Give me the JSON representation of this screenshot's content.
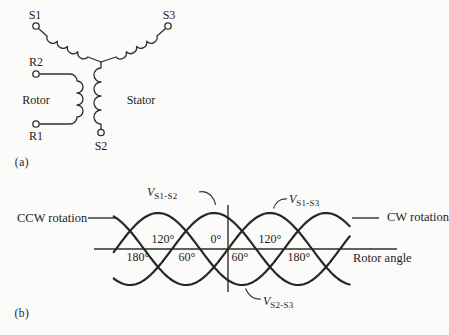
{
  "panel_a": {
    "caption": "(a)",
    "terminals": {
      "s1": "S1",
      "s3": "S3",
      "s2": "S2",
      "r2": "R2",
      "r1": "R1"
    },
    "labels": {
      "rotor": "Rotor",
      "stator": "Stator"
    }
  },
  "panel_b": {
    "caption": "(b)",
    "ccw_label": "CCW rotation",
    "cw_label": "CW rotation",
    "xaxis_label": "Rotor angle",
    "angles_above": [
      "120°",
      "0°",
      "120°"
    ],
    "angles_below": [
      "180°",
      "60°",
      "60°",
      "180°"
    ],
    "curve_labels": [
      {
        "base": "V",
        "sub": "S1-S2"
      },
      {
        "base": "V",
        "sub": "S1-S3"
      },
      {
        "base": "V",
        "sub": "S2-S3"
      }
    ],
    "chart_data": {
      "type": "line",
      "xlabel": "Rotor angle",
      "x_unit": "degrees",
      "x_ticks_deg": [
        -180,
        -120,
        -60,
        0,
        60,
        120,
        180
      ],
      "amplitude": 1,
      "period_deg": 360,
      "x_range_deg": [
        -245,
        261
      ],
      "series": [
        {
          "name": "V_S1-S2",
          "peak_deg": -30
        },
        {
          "name": "V_S1-S3",
          "peak_deg": 90
        },
        {
          "name": "V_S2-S3",
          "peak_deg": 210
        }
      ]
    }
  },
  "colors": {
    "stroke": "#2e2e2e",
    "text": "#1d1d1d",
    "background": "#fbfbfa"
  }
}
